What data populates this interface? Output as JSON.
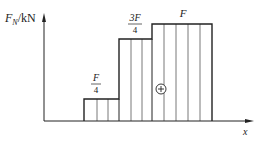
{
  "diagram": {
    "y_axis_label_main": "F",
    "y_axis_label_sub": "N",
    "y_axis_unit": "/kN",
    "x_axis_label": "x",
    "sign_symbol": "+",
    "segments": [
      {
        "label_num": "F",
        "label_den": "4",
        "value": "F/4"
      },
      {
        "label_num": "3F",
        "label_den": "4",
        "value": "3F/4"
      },
      {
        "label_num": "F",
        "label_den": "",
        "value": "F"
      }
    ],
    "colors": {
      "line": "#222222",
      "hatch": "#555555"
    }
  }
}
